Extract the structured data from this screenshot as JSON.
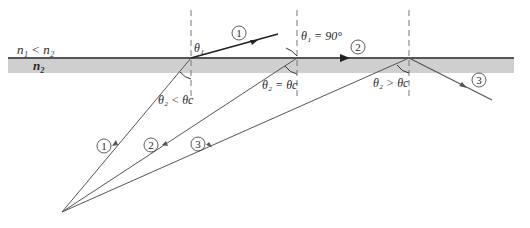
{
  "diagram": {
    "media": {
      "upper_label": "n₁ < n₂",
      "lower_label": "n₂",
      "interface_color": "#555555",
      "medium_color": "#cfcfcf"
    },
    "rays": [
      {
        "id": "1",
        "label": "1",
        "incident_label": "1",
        "angle_label_top": "θ₁",
        "angle_label_bottom": "θ₂ < θc",
        "behavior": "refracted"
      },
      {
        "id": "2",
        "label": "2",
        "incident_label": "2",
        "angle_label_top": "θ₁ = 90°",
        "angle_label_bottom": "θ₂ = θc",
        "behavior": "grazing"
      },
      {
        "id": "3",
        "label": "3",
        "incident_label": "3",
        "angle_label_top": "",
        "angle_label_bottom": "θ₂ > θc",
        "behavior": "totally reflected"
      }
    ],
    "colors": {
      "ray": "#555555",
      "normal": "#777777",
      "text": "#2a2a2a"
    }
  }
}
